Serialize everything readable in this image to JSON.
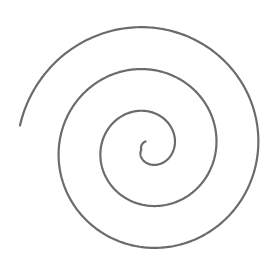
{
  "figure": {
    "type": "archimedean-spiral",
    "width": 262,
    "height": 263,
    "background": "#ffffff",
    "stroke_color": "#6b6b6b",
    "stroke_width": 2.2,
    "center": [
      148,
      148
    ],
    "start_radius": 7,
    "end_radius": 130,
    "radius_per_turn": 42,
    "direction": "counterclockwise-outward",
    "start_angle_deg": 110,
    "end_angle_deg": 1250
  }
}
